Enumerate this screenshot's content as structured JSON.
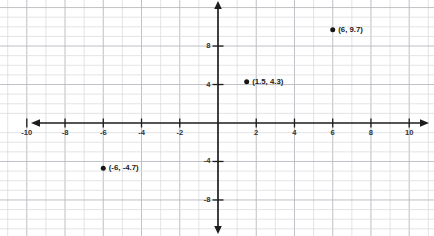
{
  "chart_data": {
    "type": "scatter",
    "title": "",
    "xlabel": "",
    "ylabel": "",
    "xlim": [
      -11.4,
      11.3
    ],
    "ylim": [
      -11.7,
      12.8
    ],
    "grid": true,
    "grid_step": 1,
    "legend": "none",
    "axis_style": "cartesian-cross-with-arrows",
    "xticks": [
      -10,
      -8,
      -6,
      -4,
      -2,
      2,
      4,
      6,
      8,
      10
    ],
    "xtick_labels": [
      "-10",
      "-8",
      "-6",
      "-4",
      "-2",
      "2",
      "4",
      "6",
      "8",
      "10"
    ],
    "yticks": [
      8,
      4,
      -4,
      -8
    ],
    "ytick_labels": [
      "8",
      "4",
      "-4",
      "-8"
    ],
    "points": [
      {
        "x": 6,
        "y": 9.7,
        "label": "(6, 9.7)"
      },
      {
        "x": 1.5,
        "y": 4.3,
        "label": "(1.5, 4.3)"
      },
      {
        "x": -6,
        "y": -4.7,
        "label": "(-6, -4.7)"
      }
    ],
    "colors": {
      "point": "#161616",
      "axis": "#1d1d1d",
      "grid_minor": "#d8d8dc",
      "grid_major": "#b9b9bf",
      "background": "#ffffff"
    }
  }
}
